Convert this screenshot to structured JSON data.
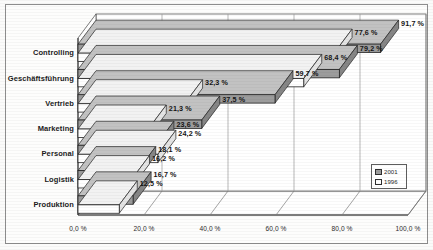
{
  "chart_data": {
    "type": "bar",
    "orientation": "horizontal",
    "title": "",
    "subtitle": "",
    "xlabel": "",
    "ylabel": "",
    "categories": [
      "Controlling",
      "Geschäftsführung",
      "Vertrieb",
      "Marketing",
      "Personal",
      "Logistik",
      "Produktion"
    ],
    "series": [
      {
        "name": "2001",
        "color": "#9c9c9c",
        "values": [
          91.7,
          79.2,
          59.7,
          37.5,
          23.6,
          18.1,
          16.7
        ],
        "labels": [
          "91,7 %",
          "79,2 %",
          "59,7 %",
          "37,5 %",
          "23,6 %",
          "18,1 %",
          "16,7 %"
        ]
      },
      {
        "name": "1996",
        "color": "#ffffff",
        "values": [
          77.6,
          68.4,
          32.3,
          21.3,
          24.2,
          16.2,
          12.5
        ],
        "labels": [
          "77,6 %",
          "68,4 %",
          "32,3 %",
          "21,3 %",
          "24,2 %",
          "16,2 %",
          "12,5 %"
        ]
      }
    ],
    "xlim": [
      0,
      100
    ],
    "xticks": [
      0,
      20,
      40,
      60,
      80,
      100
    ],
    "xticklabels": [
      "0,0 %",
      "20,0 %",
      "40,0 %",
      "60,0 %",
      "80,0 %",
      "100,0 %"
    ],
    "grid": true,
    "grid_axis": "x",
    "legend_position": "bottom-right",
    "style": "3d-perspective"
  },
  "legend": {
    "items": [
      {
        "label": "2001",
        "swatch": "gray-swatch"
      },
      {
        "label": "1996",
        "swatch": "white-swatch"
      }
    ]
  },
  "colors": {
    "series_2001": "#9c9c9c",
    "series_1996": "#ffffff",
    "bar_border": "#242424",
    "axis": "#4a4a4a",
    "grid": "#8f8f8f",
    "frame": "#8d8d8d",
    "background": "#fdfdfc",
    "text": "#141414"
  }
}
